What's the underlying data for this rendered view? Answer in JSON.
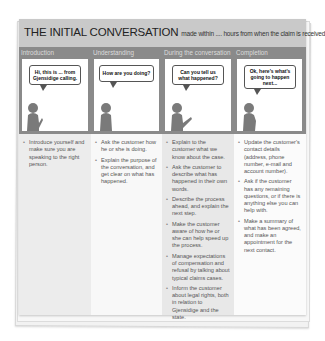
{
  "title": {
    "main": "THE INITIAL CONVERSATION",
    "sub": "made within .... hours from when the claim is received"
  },
  "columns": [
    {
      "heading": "Introduction",
      "speech": "Hi, this is ... from Gjensidige calling.",
      "bullets": [
        "Introduce yourself and make sure you are speaking to the right person."
      ]
    },
    {
      "heading": "Understanding",
      "speech": "How are you doing?",
      "bullets": [
        "Ask the customer how he or she is doing.",
        "Explain the purpose of the conversation, and get clear on what has happened."
      ]
    },
    {
      "heading": "During the conversation",
      "speech": "Can you tell us what happened?",
      "bullets": [
        "Explain to the customer what we know about the case.",
        "Ask the customer to describe what has happened in their own words.",
        "Describe the process ahead, and explain the next step.",
        "Make the customer aware of how he or she can help speed up the process.",
        "Manage expectations of compensation and refusal by talking about typical claims cases.",
        "Inform the customer about legal rights, both in relation to Gjensidige and the state."
      ]
    },
    {
      "heading": "Completion",
      "speech": "Ok, here's what's going to happen next...",
      "bullets": [
        "Update the customer's contact details (address, phone number, e-mail and account number).",
        "Ask if the customer has any remaining questions, or if there is anything else you can help with.",
        "Make a summary of what has been agreed, and make an appointment for the next contact."
      ]
    }
  ],
  "colors": {
    "title_bar": "#c9c9c9",
    "strip": "#8a8a8a",
    "figure": "#7a7a7a",
    "column_shade": "#e8e8e8"
  }
}
